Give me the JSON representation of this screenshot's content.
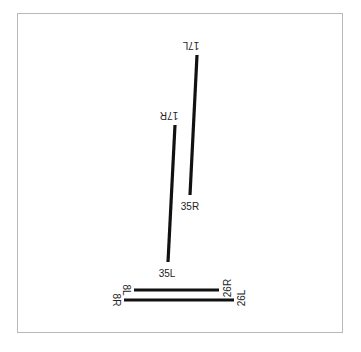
{
  "diagram": {
    "type": "airport-runway-diagram",
    "frame": {
      "x": 17,
      "y": 13,
      "width": 325,
      "height": 319,
      "stroke": "#b8b8b8"
    },
    "runway_color": "#111111",
    "runways": [
      {
        "id": "17L-35R",
        "ends": [
          {
            "label": "17L",
            "x": 197,
            "y": 55,
            "label_x": 191,
            "label_y": 45,
            "rotate": 180
          },
          {
            "label": "35R",
            "x": 190,
            "y": 195,
            "label_x": 190,
            "label_y": 206,
            "rotate": 0
          }
        ]
      },
      {
        "id": "17R-35L",
        "ends": [
          {
            "label": "17R",
            "x": 175,
            "y": 125,
            "label_x": 169,
            "label_y": 115,
            "rotate": 180
          },
          {
            "label": "35L",
            "x": 168,
            "y": 262,
            "label_x": 167,
            "label_y": 273,
            "rotate": 0
          }
        ]
      },
      {
        "id": "8L-26R",
        "ends": [
          {
            "label": "8L",
            "x": 134,
            "y": 290,
            "label_x": 126,
            "label_y": 290,
            "rotate": 90
          },
          {
            "label": "26R",
            "x": 219,
            "y": 290,
            "label_x": 227,
            "label_y": 288,
            "rotate": -90
          }
        ]
      },
      {
        "id": "8R-26L",
        "ends": [
          {
            "label": "8R",
            "x": 124,
            "y": 300,
            "label_x": 116,
            "label_y": 300,
            "rotate": 90
          },
          {
            "label": "26L",
            "x": 234,
            "y": 300,
            "label_x": 241,
            "label_y": 298,
            "rotate": -90
          }
        ]
      }
    ]
  }
}
